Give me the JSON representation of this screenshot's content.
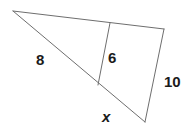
{
  "figure": {
    "kind": "triangle-with-transversal",
    "background_color": "#ffffff",
    "stroke_color": "#6e6e6e",
    "stroke_width": 1,
    "label_color": "#1b1b1b",
    "vertices": {
      "apex": {
        "x": 13,
        "y": 11
      },
      "top_right": {
        "x": 164,
        "y": 29
      },
      "bottom": {
        "x": 145,
        "y": 122
      },
      "top_divider": {
        "x": 110,
        "y": 23
      },
      "bottom_divider": {
        "x": 98,
        "y": 85
      }
    },
    "edges": [
      {
        "name": "top-edge",
        "from": "apex",
        "to": "top_right"
      },
      {
        "name": "right-edge",
        "from": "top_right",
        "to": "bottom"
      },
      {
        "name": "long-left-edge",
        "from": "apex",
        "to": "bottom"
      },
      {
        "name": "transversal",
        "from": "top_divider",
        "to": "bottom_divider"
      }
    ]
  },
  "labels": {
    "side_8": "8",
    "segment_6": "6",
    "side_10": "10",
    "side_x": "x"
  }
}
